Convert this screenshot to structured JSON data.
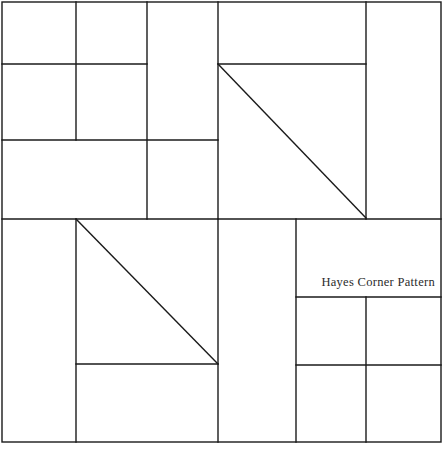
{
  "artwork": {
    "title_label": "Hayes Corner Pattern",
    "width": 443,
    "height": 451,
    "background_color": "#ffffff",
    "line_color": "#1a1a1a",
    "text_color": "#2b2b2b",
    "line_width": 1.4
  },
  "label": {
    "text": "Hayes Corner Pattern",
    "x": 435,
    "y": 286,
    "anchor": "end"
  },
  "geometry": {
    "border": {
      "x": 2,
      "y": 2,
      "width": 439,
      "height": 440
    },
    "horizontal_lines": [
      {
        "name": "h-upper-left-64",
        "x1": 2,
        "y1": 64,
        "x2": 147,
        "y2": 64
      },
      {
        "name": "h-upper-right-64",
        "x1": 218,
        "y1": 64,
        "x2": 366,
        "y2": 64
      },
      {
        "name": "h-mid-left-140",
        "x1": 2,
        "y1": 140,
        "x2": 218,
        "y2": 140
      },
      {
        "name": "h-main-divider-219",
        "x1": 2,
        "y1": 219,
        "x2": 441,
        "y2": 219
      },
      {
        "name": "h-lower-right-297",
        "x1": 296,
        "y1": 297,
        "x2": 441,
        "y2": 297
      },
      {
        "name": "h-lower-left-364",
        "x1": 76,
        "y1": 364,
        "x2": 218,
        "y2": 364
      },
      {
        "name": "h-lower-right-365",
        "x1": 296,
        "y1": 365,
        "x2": 441,
        "y2": 365
      }
    ],
    "vertical_lines": [
      {
        "name": "v-left-76-top",
        "x1": 76,
        "y1": 2,
        "x2": 76,
        "y2": 140
      },
      {
        "name": "v-left-147-top",
        "x1": 147,
        "y1": 2,
        "x2": 147,
        "y2": 219
      },
      {
        "name": "v-center-218-top",
        "x1": 218,
        "y1": 2,
        "x2": 218,
        "y2": 219
      },
      {
        "name": "v-right-366-top",
        "x1": 366,
        "y1": 2,
        "x2": 366,
        "y2": 219
      },
      {
        "name": "v-left-76-bottom",
        "x1": 76,
        "y1": 219,
        "x2": 76,
        "y2": 442
      },
      {
        "name": "v-center-218-bottom",
        "x1": 218,
        "y1": 219,
        "x2": 218,
        "y2": 442
      },
      {
        "name": "v-center-296-bottom",
        "x1": 296,
        "y1": 219,
        "x2": 296,
        "y2": 442
      },
      {
        "name": "v-right-366-bottom",
        "x1": 366,
        "y1": 297,
        "x2": 366,
        "y2": 442
      }
    ],
    "diagonals": [
      {
        "name": "diagonal-upper-right",
        "x1": 218,
        "y1": 64,
        "x2": 366,
        "y2": 218
      },
      {
        "name": "diagonal-lower-left",
        "x1": 76,
        "y1": 219,
        "x2": 218,
        "y2": 364
      }
    ]
  }
}
